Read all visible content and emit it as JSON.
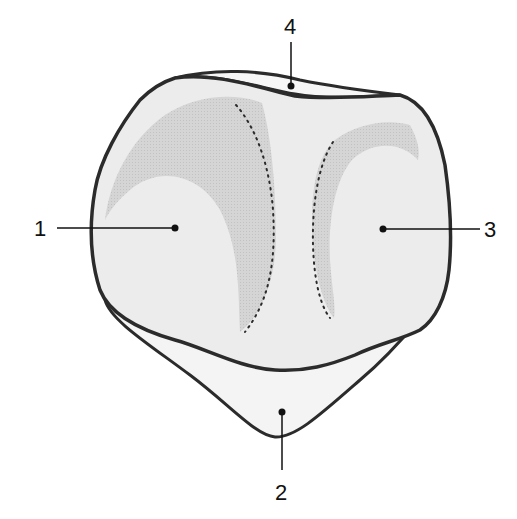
{
  "diagram": {
    "type": "anatomical-illustration",
    "labels": [
      {
        "id": "1",
        "text": "1",
        "side": "left"
      },
      {
        "id": "2",
        "text": "2",
        "side": "bottom"
      },
      {
        "id": "3",
        "text": "3",
        "side": "right"
      },
      {
        "id": "4",
        "text": "4",
        "side": "top"
      }
    ],
    "colors": {
      "outline": "#2b2b2b",
      "crown_fill": "#ececec",
      "lower_fill": "#f3f3f3",
      "shading": "#cfcfcf",
      "leader": "#111111"
    }
  }
}
